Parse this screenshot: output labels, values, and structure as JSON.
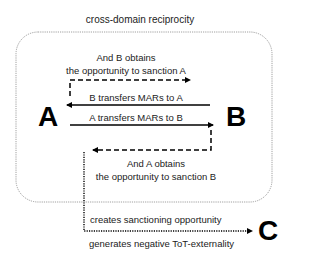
{
  "diagram": {
    "title": "cross-domain reciprocity",
    "nodes": {
      "a": "A",
      "b": "B",
      "c": "C"
    },
    "edges": {
      "b_sanction_line1": "And B obtains",
      "b_sanction_line2": "the opportunity to sanction A",
      "b_to_a": "B transfers MARs to A",
      "a_to_b": "A transfers MARs to B",
      "a_sanction_line1": "And A obtains",
      "a_sanction_line2": "the opportunity to sanction B",
      "to_c_top": "creates sanctioning opportunity",
      "to_c_bottom": "generates negative ToT-externality"
    },
    "colors": {
      "stroke": "#000000",
      "box_border": "#888888",
      "text": "#222222"
    }
  }
}
